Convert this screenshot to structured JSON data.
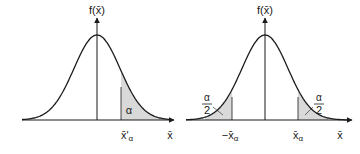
{
  "diagrams": [
    {
      "id": "one-sided",
      "y_axis_label": "f(x̄)",
      "x_axis_label": "x̄",
      "tail_area_label": "α",
      "critical_value_label": "x̄'",
      "critical_value_subscript": "α",
      "shaded_tails": [
        "right"
      ]
    },
    {
      "id": "two-sided",
      "y_axis_label": "f(x̄)",
      "x_axis_label": "x̄",
      "tail_area_numerator": "α",
      "tail_area_denominator": "2",
      "left_critical_value_label": "−x̄",
      "right_critical_value_label": "x̄",
      "critical_value_subscript": "α",
      "shaded_tails": [
        "left",
        "right"
      ]
    }
  ],
  "colors": {
    "line": "#1a1a1a",
    "shade": "#d9d9d9"
  }
}
